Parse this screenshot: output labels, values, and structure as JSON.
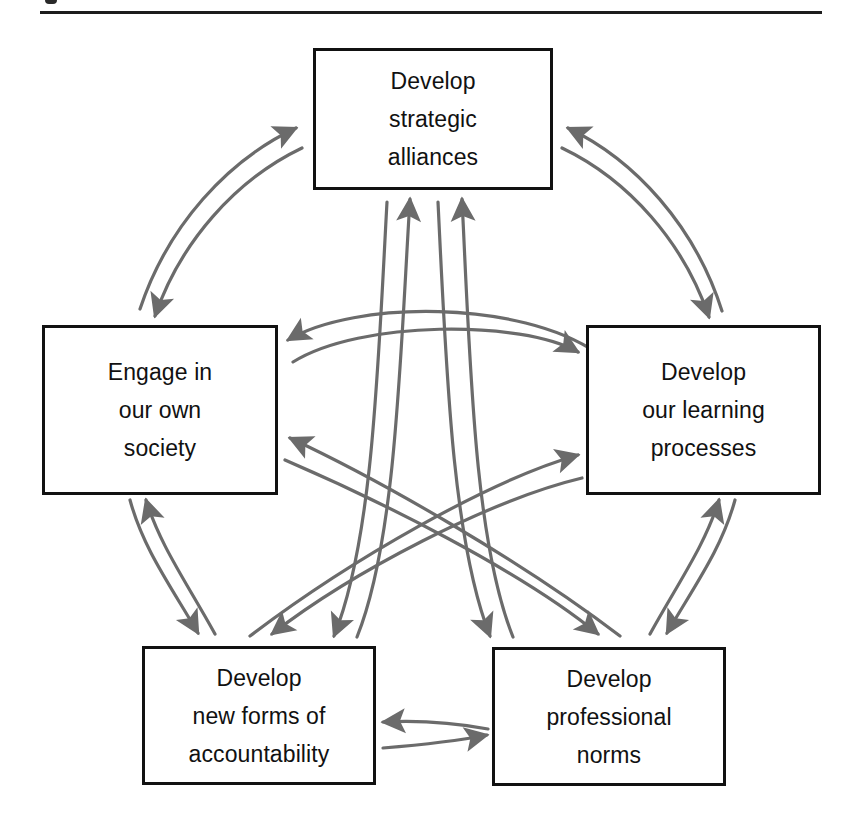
{
  "page": {
    "background_color": "#ffffff",
    "divider_color": "#1d1d1d",
    "box_border_color": "#111111",
    "arrow_color": "#6b6b6b",
    "text_color": "#111111"
  },
  "diagram": {
    "type": "cycle-network",
    "arrow_style": "curved double-headed pairs",
    "nodes": [
      {
        "id": "strategic-alliances",
        "label": "Develop\nstrategic\nalliances",
        "lines": [
          "Develop",
          "strategic",
          "alliances"
        ],
        "position": "top"
      },
      {
        "id": "own-society",
        "label": "Engage in\nour own\nsociety",
        "lines": [
          "Engage in",
          "our own",
          "society"
        ],
        "position": "left"
      },
      {
        "id": "learning-processes",
        "label": "Develop\nour learning\nprocesses",
        "lines": [
          "Develop",
          "our learning",
          "processes"
        ],
        "position": "right"
      },
      {
        "id": "accountability",
        "label": "Develop\nnew forms of\naccountability",
        "lines": [
          "Develop",
          "new forms of",
          "accountability"
        ],
        "position": "bottom-left"
      },
      {
        "id": "professional-norms",
        "label": "Develop\nprofessional\nnorms",
        "lines": [
          "Develop",
          "professional",
          "norms"
        ],
        "position": "bottom-right"
      }
    ],
    "connections": [
      {
        "from": "strategic-alliances",
        "to": "own-society",
        "bidirectional": true
      },
      {
        "from": "strategic-alliances",
        "to": "learning-processes",
        "bidirectional": true
      },
      {
        "from": "strategic-alliances",
        "to": "accountability",
        "bidirectional": true
      },
      {
        "from": "strategic-alliances",
        "to": "professional-norms",
        "bidirectional": true
      },
      {
        "from": "own-society",
        "to": "learning-processes",
        "bidirectional": true
      },
      {
        "from": "own-society",
        "to": "accountability",
        "bidirectional": true
      },
      {
        "from": "own-society",
        "to": "professional-norms",
        "bidirectional": true
      },
      {
        "from": "learning-processes",
        "to": "accountability",
        "bidirectional": true
      },
      {
        "from": "learning-processes",
        "to": "professional-norms",
        "bidirectional": true
      },
      {
        "from": "accountability",
        "to": "professional-norms",
        "bidirectional": true
      }
    ]
  }
}
